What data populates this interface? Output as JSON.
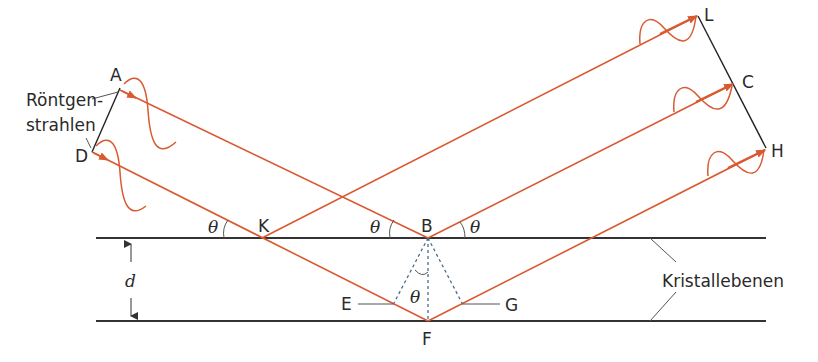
{
  "figure": {
    "labels": {
      "A": "A",
      "D": "D",
      "K": "K",
      "B": "B",
      "E": "E",
      "F": "F",
      "G": "G",
      "L": "L",
      "C": "C",
      "H": "H",
      "theta": "θ",
      "d": "d",
      "xray_line1": "Röntgen-",
      "xray_line2": "strahlen",
      "planes": "Kristallebenen"
    },
    "colors": {
      "ray": "#d95a32",
      "plane": "#333333",
      "dotted": "#4a6e8a",
      "text": "#2a2a2a"
    }
  }
}
